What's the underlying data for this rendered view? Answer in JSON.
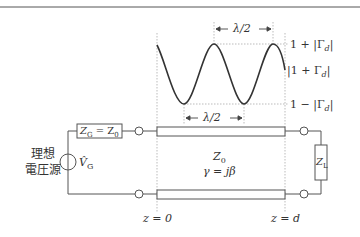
{
  "diagram": {
    "standing_wave": {
      "top_wavelength_label": "λ/2",
      "bottom_wavelength_label": "λ/2",
      "max_label": "1 + |Γ",
      "max_sub": "d",
      "max_tail": "|",
      "mid_label": "|1 + Γ",
      "mid_sub": "d",
      "mid_tail": "|",
      "min_label": "1 − |Γ",
      "min_sub": "d",
      "min_tail": "|"
    },
    "source": {
      "label_line1": "理想",
      "label_line2": "電圧源",
      "voltage_symbol": "V̂",
      "voltage_sub": "G"
    },
    "generator_impedance": {
      "z": "Z",
      "z_sub": "G",
      "eq": " = Z",
      "z0_sub": "0"
    },
    "line": {
      "impedance": "Z",
      "impedance_sub": "0",
      "propagation": "γ = jβ"
    },
    "load": {
      "z": "Z",
      "z_sub": "L"
    },
    "positions": {
      "start": "z = 0",
      "end": "z = d"
    }
  }
}
